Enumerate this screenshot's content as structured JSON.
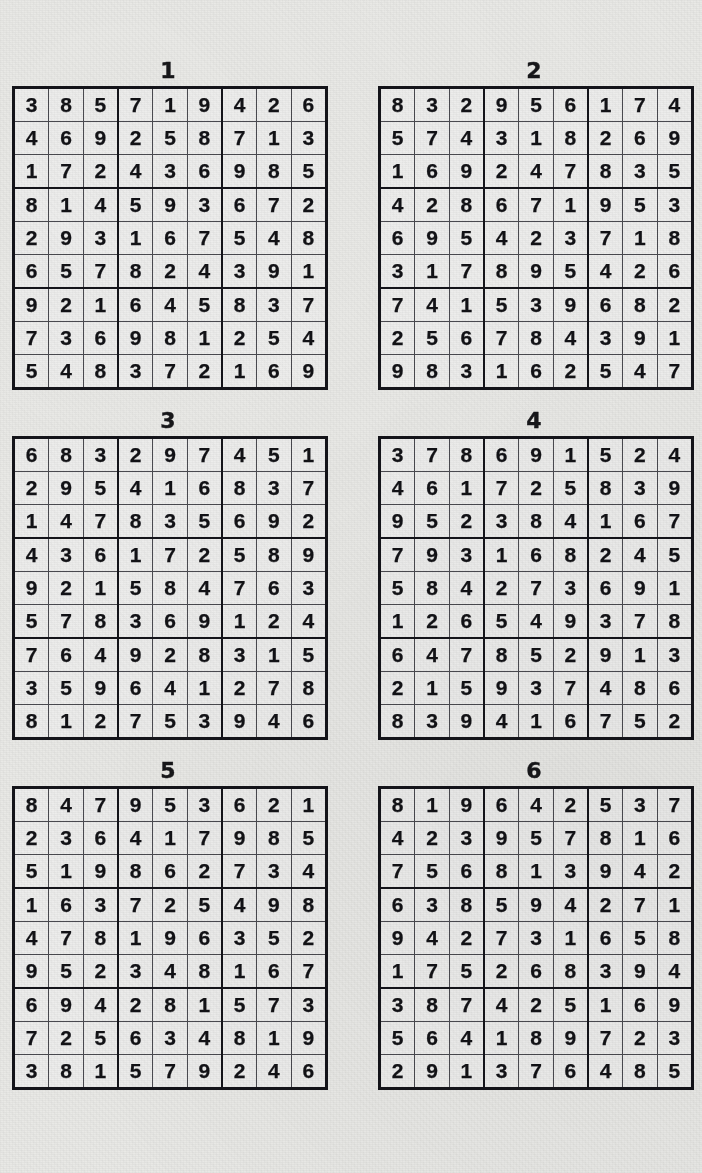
{
  "page": {
    "kind": "sudoku-solutions-sheet",
    "background_color": "#e9e9e6",
    "ink_color": "#121216",
    "puzzle_count": 6,
    "grid_size": 9,
    "columns": 2
  },
  "puzzles": [
    {
      "title": "1",
      "rows": [
        [
          3,
          8,
          5,
          7,
          1,
          9,
          4,
          2,
          6
        ],
        [
          4,
          6,
          9,
          2,
          5,
          8,
          7,
          1,
          3
        ],
        [
          1,
          7,
          2,
          4,
          3,
          6,
          9,
          8,
          5
        ],
        [
          8,
          1,
          4,
          5,
          9,
          3,
          6,
          7,
          2
        ],
        [
          2,
          9,
          3,
          1,
          6,
          7,
          5,
          4,
          8
        ],
        [
          6,
          5,
          7,
          8,
          2,
          4,
          3,
          9,
          1
        ],
        [
          9,
          2,
          1,
          6,
          4,
          5,
          8,
          3,
          7
        ],
        [
          7,
          3,
          6,
          9,
          8,
          1,
          2,
          5,
          4
        ],
        [
          5,
          4,
          8,
          3,
          7,
          2,
          1,
          6,
          9
        ]
      ]
    },
    {
      "title": "2",
      "rows": [
        [
          8,
          3,
          2,
          9,
          5,
          6,
          1,
          7,
          4
        ],
        [
          5,
          7,
          4,
          3,
          1,
          8,
          2,
          6,
          9
        ],
        [
          1,
          6,
          9,
          2,
          4,
          7,
          8,
          3,
          5
        ],
        [
          4,
          2,
          8,
          6,
          7,
          1,
          9,
          5,
          3
        ],
        [
          6,
          9,
          5,
          4,
          2,
          3,
          7,
          1,
          8
        ],
        [
          3,
          1,
          7,
          8,
          9,
          5,
          4,
          2,
          6
        ],
        [
          7,
          4,
          1,
          5,
          3,
          9,
          6,
          8,
          2
        ],
        [
          2,
          5,
          6,
          7,
          8,
          4,
          3,
          9,
          1
        ],
        [
          9,
          8,
          3,
          1,
          6,
          2,
          5,
          4,
          7
        ]
      ]
    },
    {
      "title": "3",
      "rows": [
        [
          6,
          8,
          3,
          2,
          9,
          7,
          4,
          5,
          1
        ],
        [
          2,
          9,
          5,
          4,
          1,
          6,
          8,
          3,
          7
        ],
        [
          1,
          4,
          7,
          8,
          3,
          5,
          6,
          9,
          2
        ],
        [
          4,
          3,
          6,
          1,
          7,
          2,
          5,
          8,
          9
        ],
        [
          9,
          2,
          1,
          5,
          8,
          4,
          7,
          6,
          3
        ],
        [
          5,
          7,
          8,
          3,
          6,
          9,
          1,
          2,
          4
        ],
        [
          7,
          6,
          4,
          9,
          2,
          8,
          3,
          1,
          5
        ],
        [
          3,
          5,
          9,
          6,
          4,
          1,
          2,
          7,
          8
        ],
        [
          8,
          1,
          2,
          7,
          5,
          3,
          9,
          4,
          6
        ]
      ]
    },
    {
      "title": "4",
      "rows": [
        [
          3,
          7,
          8,
          6,
          9,
          1,
          5,
          2,
          4
        ],
        [
          4,
          6,
          1,
          7,
          2,
          5,
          8,
          3,
          9
        ],
        [
          9,
          5,
          2,
          3,
          8,
          4,
          1,
          6,
          7
        ],
        [
          7,
          9,
          3,
          1,
          6,
          8,
          2,
          4,
          5
        ],
        [
          5,
          8,
          4,
          2,
          7,
          3,
          6,
          9,
          1
        ],
        [
          1,
          2,
          6,
          5,
          4,
          9,
          3,
          7,
          8
        ],
        [
          6,
          4,
          7,
          8,
          5,
          2,
          9,
          1,
          3
        ],
        [
          2,
          1,
          5,
          9,
          3,
          7,
          4,
          8,
          6
        ],
        [
          8,
          3,
          9,
          4,
          1,
          6,
          7,
          5,
          2
        ]
      ]
    },
    {
      "title": "5",
      "rows": [
        [
          8,
          4,
          7,
          9,
          5,
          3,
          6,
          2,
          1
        ],
        [
          2,
          3,
          6,
          4,
          1,
          7,
          9,
          8,
          5
        ],
        [
          5,
          1,
          9,
          8,
          6,
          2,
          7,
          3,
          4
        ],
        [
          1,
          6,
          3,
          7,
          2,
          5,
          4,
          9,
          8
        ],
        [
          4,
          7,
          8,
          1,
          9,
          6,
          3,
          5,
          2
        ],
        [
          9,
          5,
          2,
          3,
          4,
          8,
          1,
          6,
          7
        ],
        [
          6,
          9,
          4,
          2,
          8,
          1,
          5,
          7,
          3
        ],
        [
          7,
          2,
          5,
          6,
          3,
          4,
          8,
          1,
          9
        ],
        [
          3,
          8,
          1,
          5,
          7,
          9,
          2,
          4,
          6
        ]
      ]
    },
    {
      "title": "6",
      "rows": [
        [
          8,
          1,
          9,
          6,
          4,
          2,
          5,
          3,
          7
        ],
        [
          4,
          2,
          3,
          9,
          5,
          7,
          8,
          1,
          6
        ],
        [
          7,
          5,
          6,
          8,
          1,
          3,
          9,
          4,
          2
        ],
        [
          6,
          3,
          8,
          5,
          9,
          4,
          2,
          7,
          1
        ],
        [
          9,
          4,
          2,
          7,
          3,
          1,
          6,
          5,
          8
        ],
        [
          1,
          7,
          5,
          2,
          6,
          8,
          3,
          9,
          4
        ],
        [
          3,
          8,
          7,
          4,
          2,
          5,
          1,
          6,
          9
        ],
        [
          5,
          6,
          4,
          1,
          8,
          9,
          7,
          2,
          3
        ],
        [
          2,
          9,
          1,
          3,
          7,
          6,
          4,
          8,
          5
        ]
      ]
    }
  ]
}
